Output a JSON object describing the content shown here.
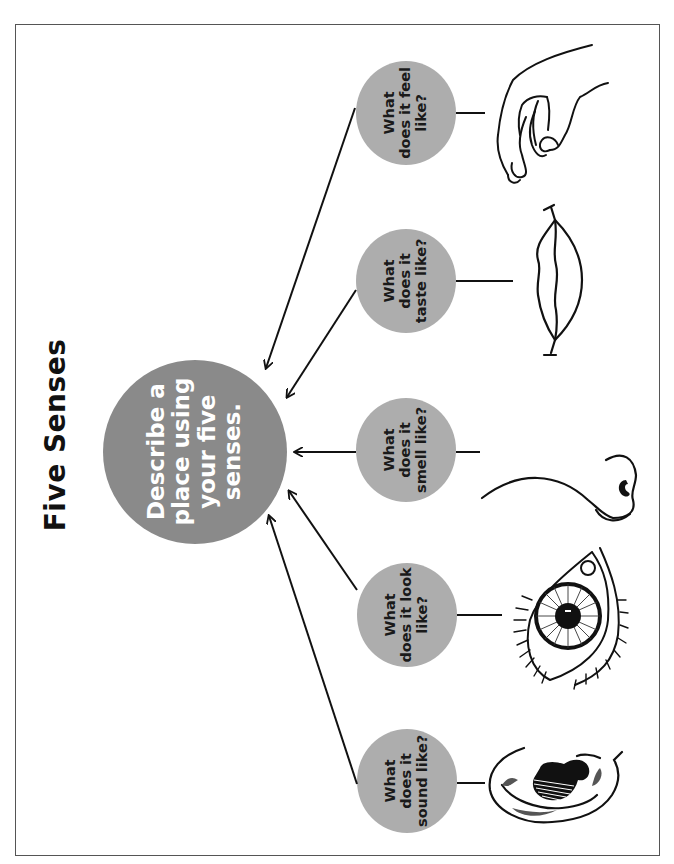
{
  "title": "Five Senses",
  "central": {
    "text": "Describe a place using your five senses.",
    "lines": "Describe a\nplace using\nyour five\nsenses.",
    "color": "#8a8a8a"
  },
  "senses": [
    {
      "id": "feel",
      "lines": "What\ndoes it feel\nlike?",
      "icon": "hand-icon",
      "color": "#adadad"
    },
    {
      "id": "taste",
      "lines": "What\ndoes it\ntaste like?",
      "icon": "lips-icon",
      "color": "#adadad"
    },
    {
      "id": "smell",
      "lines": "What\ndoes it\nsmell like?",
      "icon": "nose-icon",
      "color": "#adadad"
    },
    {
      "id": "look",
      "lines": "What\ndoes it look\nlike?",
      "icon": "eye-icon",
      "color": "#adadad"
    },
    {
      "id": "sound",
      "lines": "What\ndoes it\nsound like?",
      "icon": "ear-icon",
      "color": "#adadad"
    }
  ]
}
